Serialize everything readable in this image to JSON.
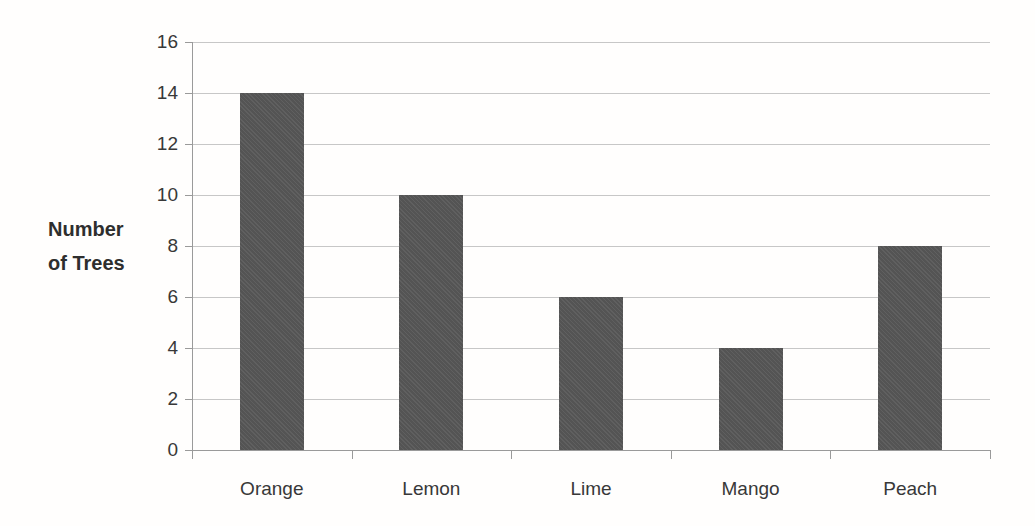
{
  "chart_data": {
    "type": "bar",
    "title": "",
    "categories": [
      "Orange",
      "Lemon",
      "Lime",
      "Mango",
      "Peach"
    ],
    "values": [
      14,
      10,
      6,
      4,
      8
    ],
    "xlabel": "",
    "ylabel": "Number of Trees",
    "ylabel_lines": [
      "Number",
      "of Trees"
    ],
    "ylim": [
      0,
      16
    ],
    "yticks": [
      0,
      2,
      4,
      6,
      8,
      10,
      12,
      14,
      16
    ],
    "grid": true,
    "legend": false,
    "colors": {
      "bar": "#575757",
      "gridline": "#c7c7c7",
      "axis": "#9a9a9a",
      "text": "#383838",
      "background": "#fffefd"
    }
  }
}
